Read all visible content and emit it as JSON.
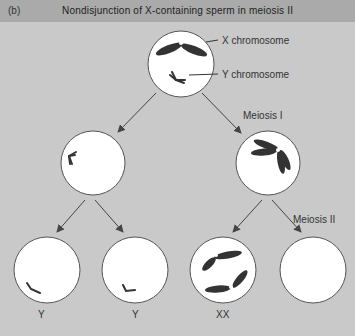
{
  "header": {
    "panel_label": "(b)",
    "title": "Nondisjunction of X-containing sperm in meiosis II"
  },
  "annotations": {
    "x_chromosome": "X chromosome",
    "y_chromosome": "Y chromosome",
    "meiosis_1": "Meiosis I",
    "meiosis_2": "Meiosis II"
  },
  "cells": [
    {
      "id": "parent",
      "contents": "X and Y chromosomes"
    },
    {
      "id": "meiosis1-left",
      "contents": "Y chromosome (duplicated)"
    },
    {
      "id": "meiosis1-right",
      "contents": "X chromosome (duplicated)"
    },
    {
      "id": "gamete-1",
      "label": "Y"
    },
    {
      "id": "gamete-2",
      "label": "Y"
    },
    {
      "id": "gamete-3",
      "label": "XX"
    },
    {
      "id": "gamete-4",
      "label": ""
    }
  ],
  "colors": {
    "background": "#c9c9c9",
    "header": "#aaaaaa",
    "cell_fill": "#ffffff",
    "cell_stroke": "#555555",
    "chromosome": "#333333",
    "arrow": "#444444"
  }
}
